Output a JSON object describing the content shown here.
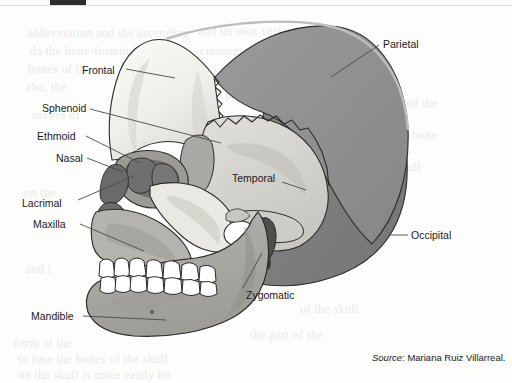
{
  "figure": {
    "background_color": "#fdfdfc",
    "source_prefix": "Source",
    "source_separator": ": ",
    "source_text": "Mariana Ruiz Villarreal."
  },
  "palette": {
    "frontal": "#f2f1ec",
    "parietal": "#8f8f8f",
    "occipital": "#7e7e7e",
    "temporal": "#d6d5d0",
    "sphenoid": "#a8a8a4",
    "ethmoid": "#6f6f6f",
    "nasal": "#6a6a6a",
    "lacrimal": "#777777",
    "maxilla": "#b4b3ae",
    "zygomatic": "#cdccc6",
    "mandible": "#a9a8a3",
    "teeth": "#ffffff",
    "outline": "#2b2b2b",
    "leader_line": "#4a4a4a",
    "label_text": "#1b1b1b",
    "scan_bar": "#2d2d2d"
  },
  "labels": [
    {
      "id": "frontal",
      "name": "Frontal",
      "x": 82,
      "y": 64,
      "anchor": "end"
    },
    {
      "id": "sphenoid",
      "name": "Sphenoid",
      "x": 42,
      "y": 102,
      "anchor": "end"
    },
    {
      "id": "ethmoid",
      "name": "Ethmoid",
      "x": 37,
      "y": 130,
      "anchor": "end"
    },
    {
      "id": "nasal",
      "name": "Nasal",
      "x": 56,
      "y": 152,
      "anchor": "end"
    },
    {
      "id": "lacrimal",
      "name": "Lacrimal",
      "x": 22,
      "y": 197,
      "anchor": "end"
    },
    {
      "id": "maxilla",
      "name": "Maxilla",
      "x": 33,
      "y": 218,
      "anchor": "end"
    },
    {
      "id": "mandible",
      "name": "Mandible",
      "x": 31,
      "y": 310,
      "anchor": "end"
    },
    {
      "id": "zygomatic",
      "name": "Zygomatic",
      "x": 246,
      "y": 289,
      "anchor": "start"
    },
    {
      "id": "temporal",
      "name": "Temporal",
      "x": 232,
      "y": 172,
      "anchor": "start"
    },
    {
      "id": "parietal",
      "name": "Parietal",
      "x": 383,
      "y": 38,
      "anchor": "start"
    },
    {
      "id": "occipital",
      "name": "Occipital",
      "x": 411,
      "y": 229,
      "anchor": "start"
    }
  ],
  "leaders": [
    {
      "id": "frontal-leader",
      "x1": 126,
      "y1": 69,
      "x2": 175,
      "y2": 78
    },
    {
      "id": "sphenoid-leader",
      "x1": 90,
      "y1": 109,
      "x2": 221,
      "y2": 143
    },
    {
      "id": "ethmoid-leader",
      "x1": 86,
      "y1": 136,
      "x2": 140,
      "y2": 163
    },
    {
      "id": "nasal-leader",
      "x1": 87,
      "y1": 158,
      "x2": 123,
      "y2": 172
    },
    {
      "id": "lacrimal-leader",
      "x1": 78,
      "y1": 200,
      "x2": 134,
      "y2": 176
    },
    {
      "id": "maxilla-leader",
      "x1": 80,
      "y1": 224,
      "x2": 144,
      "y2": 251
    },
    {
      "id": "mandible-leader",
      "x1": 83,
      "y1": 316,
      "x2": 166,
      "y2": 320
    },
    {
      "id": "zygomatic-leader",
      "x1": 243,
      "y1": 288,
      "x2": 262,
      "y2": 253
    },
    {
      "id": "temporal-leader",
      "x1": 282,
      "y1": 182,
      "x2": 306,
      "y2": 190
    },
    {
      "id": "parietal-leader",
      "x1": 379,
      "y1": 45,
      "x2": 331,
      "y2": 77
    },
    {
      "id": "occipital-leader",
      "x1": 408,
      "y1": 235,
      "x2": 390,
      "y2": 235
    }
  ],
  "bleed_text": [
    {
      "x": 28,
      "y": 26,
      "text": "abbreviation and the ascending"
    },
    {
      "x": 198,
      "y": 24,
      "text": "and its own variation of the"
    },
    {
      "x": 30,
      "y": 44,
      "text": "da    the bone-forming"
    },
    {
      "x": 200,
      "y": 44,
      "text": "cranium sutures the skull"
    },
    {
      "x": 28,
      "y": 62,
      "text": "bones of the"
    },
    {
      "x": 210,
      "y": 66,
      "text": "the bones which surround"
    },
    {
      "x": 26,
      "y": 80,
      "text": "aba, the"
    },
    {
      "x": 216,
      "y": 88,
      "text": "a protective case for the"
    },
    {
      "x": 32,
      "y": 108,
      "text": "nerves of"
    },
    {
      "x": 222,
      "y": 112,
      "text": "sections join in a line"
    },
    {
      "x": 230,
      "y": 136,
      "text": "the shape of adult"
    },
    {
      "x": 236,
      "y": 160,
      "text": "and the joints"
    },
    {
      "x": 24,
      "y": 186,
      "text": "on the"
    },
    {
      "x": 250,
      "y": 182,
      "text": "bone is"
    },
    {
      "x": 26,
      "y": 262,
      "text": "and t"
    },
    {
      "x": 14,
      "y": 336,
      "text": "form of the"
    },
    {
      "x": 18,
      "y": 352,
      "text": "to fuse the bones of the skull"
    },
    {
      "x": 18,
      "y": 368,
      "text": "on the skull is more easily bo"
    },
    {
      "x": 250,
      "y": 328,
      "text": "the part of the"
    },
    {
      "x": 300,
      "y": 302,
      "text": "of the skull"
    },
    {
      "x": 400,
      "y": 96,
      "text": "and the"
    },
    {
      "x": 398,
      "y": 128,
      "text": "of bone"
    },
    {
      "x": 396,
      "y": 160,
      "text": "skull"
    }
  ]
}
